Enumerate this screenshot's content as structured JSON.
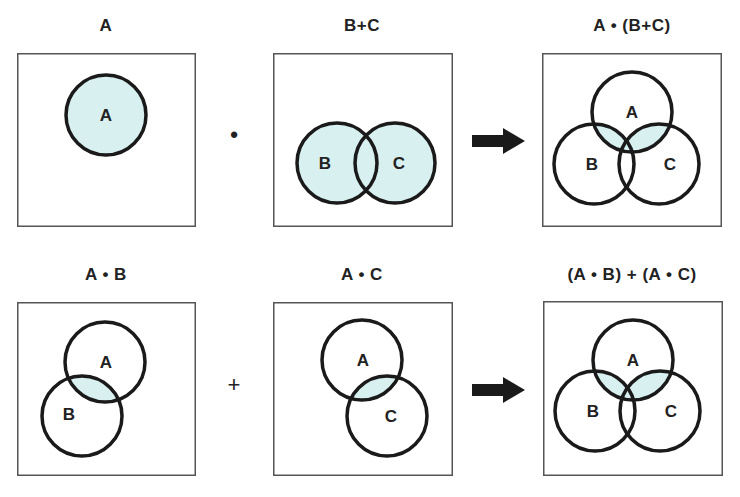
{
  "colors": {
    "fill": "#d8f0f0",
    "stroke": "#1a1a1a",
    "frame": "#555555"
  },
  "rows": [
    {
      "panels": [
        {
          "title": "A",
          "highlight": "A",
          "circles": [
            {
              "label": "A",
              "cx": 89,
              "cy": 62
            }
          ]
        },
        {
          "title": "B+C",
          "highlight": "B|C",
          "circles": [
            {
              "label": "B",
              "cx": 64,
              "cy": 110
            },
            {
              "label": "C",
              "cx": 122,
              "cy": 110
            }
          ]
        },
        {
          "title": "A • (B+C)",
          "highlight": "A&(B|C)",
          "circles": [
            {
              "label": "A",
              "cx": 90,
              "cy": 59
            },
            {
              "label": "B",
              "cx": 52,
              "cy": 111
            },
            {
              "label": "C",
              "cx": 117,
              "cy": 111
            }
          ]
        }
      ],
      "operator": "•",
      "arrow": "right-arrow"
    },
    {
      "panels": [
        {
          "title": "A • B",
          "highlight": "A&B",
          "circles": [
            {
              "label": "A",
              "cx": 88,
              "cy": 60
            },
            {
              "label": "B",
              "cx": 65,
              "cy": 114
            }
          ]
        },
        {
          "title": "A • C",
          "highlight": "A&C",
          "circles": [
            {
              "label": "A",
              "cx": 89,
              "cy": 58
            },
            {
              "label": "C",
              "cx": 114,
              "cy": 114
            }
          ]
        },
        {
          "title": "(A • B) + (A • C)",
          "highlight": "A&(B|C)",
          "circles": [
            {
              "label": "A",
              "cx": 90,
              "cy": 59
            },
            {
              "label": "B",
              "cx": 52,
              "cy": 110
            },
            {
              "label": "C",
              "cx": 117,
              "cy": 110
            }
          ]
        }
      ],
      "operator": "+",
      "arrow": "right-arrow"
    }
  ],
  "radius": 40
}
